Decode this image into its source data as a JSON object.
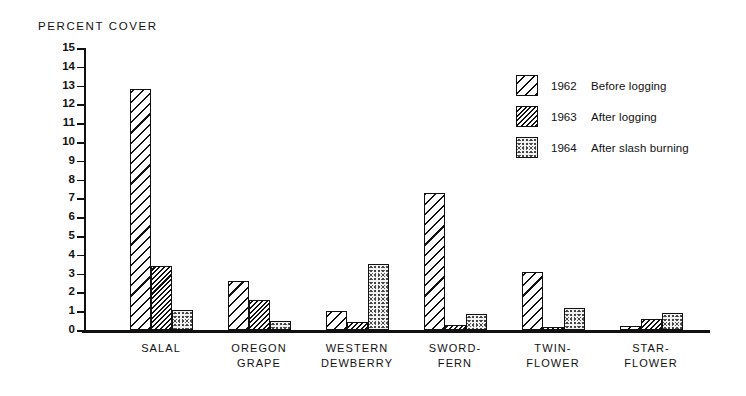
{
  "chart_data": {
    "type": "bar",
    "title": "",
    "ylabel": "PERCENT COVER",
    "xlabel": "",
    "ylim": [
      0,
      15
    ],
    "y_ticks": [
      0,
      1,
      2,
      3,
      4,
      5,
      6,
      7,
      8,
      9,
      10,
      11,
      12,
      13,
      14,
      15
    ],
    "grid": false,
    "legend_position": "upper right",
    "categories": [
      "SALAL",
      "OREGON\nGRAPE",
      "WESTERN\nDEWBERRY",
      "SWORD-\nFERN",
      "TWIN-\nFLOWER",
      "STAR-\nFLOWER"
    ],
    "series": [
      {
        "name": "1962 Before logging",
        "year": "1962",
        "description": "Before logging",
        "pattern": "wide-diagonal-hatch",
        "values": [
          12.8,
          2.6,
          1.0,
          7.3,
          3.1,
          0.2
        ]
      },
      {
        "name": "1963 After logging",
        "year": "1963",
        "description": "After logging",
        "pattern": "dense-diagonal-hatch",
        "values": [
          3.4,
          1.6,
          0.4,
          0.25,
          0.15,
          0.6
        ]
      },
      {
        "name": "1964 After slash burning",
        "year": "1964",
        "description": "After slash burning",
        "pattern": "stipple-dots",
        "values": [
          1.05,
          0.5,
          3.5,
          0.85,
          1.15,
          0.9
        ]
      }
    ],
    "colors": {
      "ink": "#111111",
      "background": "#ffffff",
      "stipple_fill": "#f2f2f2"
    }
  }
}
